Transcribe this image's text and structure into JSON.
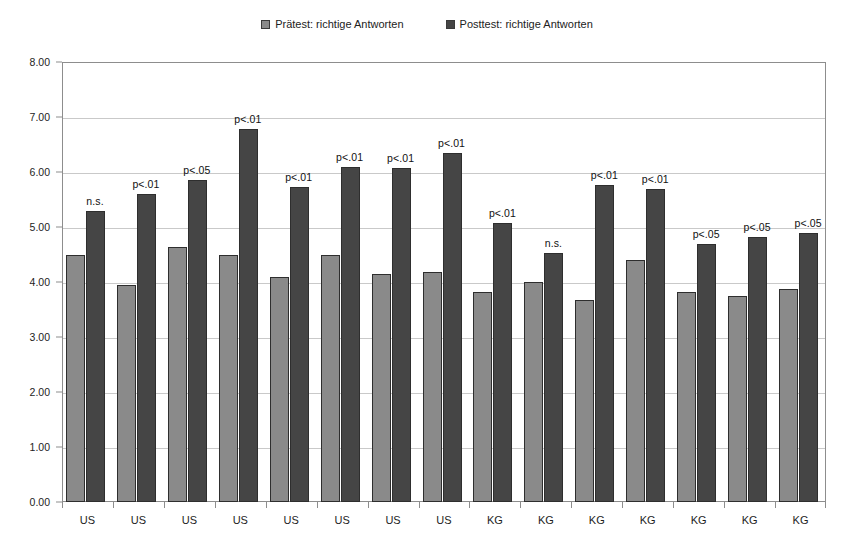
{
  "chart_data": {
    "type": "bar",
    "title": "",
    "subtitle": "",
    "xlabel": "",
    "ylabel": "",
    "ylim": [
      0,
      8
    ],
    "ytick_step": 1,
    "ytick_labels": [
      "0.00",
      "1.00",
      "2.00",
      "3.00",
      "4.00",
      "5.00",
      "6.00",
      "7.00",
      "8.00"
    ],
    "grid": true,
    "legend_position": "top-center",
    "categories": [
      "US",
      "US",
      "US",
      "US",
      "US",
      "US",
      "US",
      "US",
      "KG",
      "KG",
      "KG",
      "KG",
      "KG",
      "KG",
      "KG"
    ],
    "series": [
      {
        "name": "Prätest: richtige Antworten",
        "color": "#8a8a8a",
        "values": [
          4.5,
          3.95,
          4.63,
          4.5,
          4.1,
          4.5,
          4.15,
          4.18,
          3.82,
          4.0,
          3.68,
          4.4,
          3.82,
          3.75,
          3.88
        ]
      },
      {
        "name": "Posttest: richtige Antworten",
        "color": "#454545",
        "values": [
          5.3,
          5.6,
          5.85,
          6.78,
          5.73,
          6.1,
          6.08,
          6.35,
          5.08,
          4.52,
          5.77,
          5.7,
          4.7,
          4.82,
          4.9
        ]
      }
    ],
    "annotations": [
      "n.s.",
      "p<.01",
      "p<.05",
      "p<.01",
      "p<.01",
      "p<.01",
      "p<.01",
      "p<.01",
      "p<.01",
      "n.s.",
      "p<.01",
      "p<.01",
      "p<.05",
      "p<.05",
      "p<.05"
    ]
  },
  "legend": {
    "entries": [
      {
        "label": "Prätest: richtige Antworten",
        "color": "#8a8a8a"
      },
      {
        "label": "Posttest: richtige Antworten",
        "color": "#454545"
      }
    ]
  }
}
